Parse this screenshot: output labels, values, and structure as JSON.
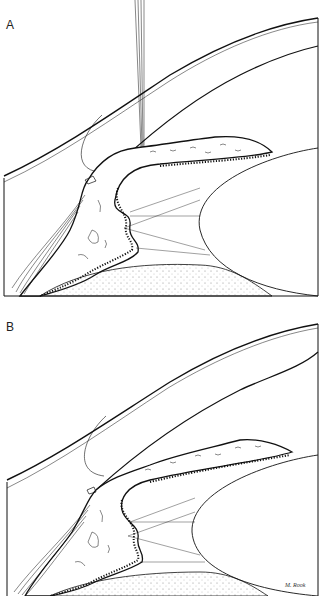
{
  "figure": {
    "panels": [
      {
        "label": "A",
        "description": "Anterior chamber angle with laser beam directed at peripheral iris (narrow angle, iris bowed forward)"
      },
      {
        "label": "B",
        "description": "Anterior chamber angle after treatment (iris flattened, angle widened)"
      }
    ],
    "signature": "M. Rook",
    "colors": {
      "line": "#111111",
      "background": "#ffffff",
      "stipple": "#777777"
    }
  }
}
